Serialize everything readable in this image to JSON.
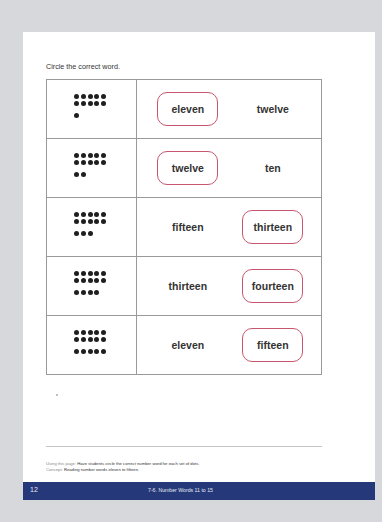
{
  "worksheet": {
    "instruction": "Circle the correct word.",
    "accent_color": "#c9566e",
    "rows": [
      {
        "dots_full_rows": 2,
        "dots_extra": 1,
        "count": 11,
        "left": "eleven",
        "right": "twelve",
        "circled": "left"
      },
      {
        "dots_full_rows": 2,
        "dots_extra": 2,
        "count": 12,
        "left": "twelve",
        "right": "ten",
        "circled": "left"
      },
      {
        "dots_full_rows": 2,
        "dots_extra": 3,
        "count": 13,
        "left": "fifteen",
        "right": "thirteen",
        "circled": "right"
      },
      {
        "dots_full_rows": 2,
        "dots_extra": 4,
        "count": 14,
        "left": "thirteen",
        "right": "fourteen",
        "circled": "right"
      },
      {
        "dots_full_rows": 2,
        "dots_extra": 5,
        "count": 15,
        "left": "eleven",
        "right": "fifteen",
        "circled": "right"
      }
    ]
  },
  "notes": {
    "using_label": "Using this page:",
    "using_text": "Have students circle the correct number word for each set of dots.",
    "concept_label": "Concept:",
    "concept_text": "Reading number words eleven to fifteen."
  },
  "footer": {
    "page_number": "12",
    "lesson_title": "7-6. Number Words 11 to 15",
    "bar_color": "#24387a"
  }
}
